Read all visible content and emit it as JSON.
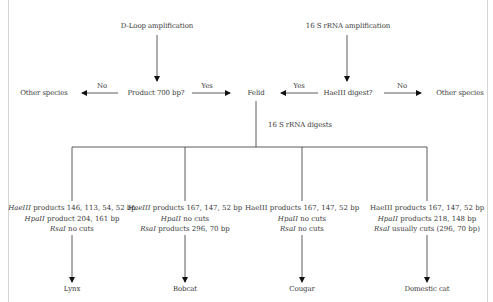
{
  "diagram": {
    "type": "flowchart",
    "start_nodes": {
      "dloop": "D-Loop amplification",
      "rrna": "16 S rRNA amplification"
    },
    "decisions": {
      "product_700": "Product 700 bp?",
      "haeiii_digest": "HaeIII digest?"
    },
    "outcomes": {
      "other_species_left": "Other species",
      "felid": "Felid",
      "other_species_right": "Other species"
    },
    "edge_labels": {
      "no_left": "No",
      "yes_left": "Yes",
      "yes_right": "Yes",
      "no_right": "No",
      "digests": "16 S rRNA digests"
    },
    "branches": [
      {
        "lines": [
          {
            "enzyme": "HaeIII",
            "text": " products 146, 113, 54, 52 bp"
          },
          {
            "enzyme": "HpaII",
            "text": " product 204, 161 bp"
          },
          {
            "enzyme": "RsaI",
            "text": " no cuts"
          }
        ],
        "result": "Lynx"
      },
      {
        "lines": [
          {
            "enzyme": "HaeIII",
            "text": " products 167, 147, 52 bp"
          },
          {
            "enzyme": "HpaII",
            "text": " no cuts"
          },
          {
            "enzyme": "RsaI",
            "text": " products 296, 70 bp"
          }
        ],
        "result": "Bobcat"
      },
      {
        "lines": [
          {
            "enzyme": "HaeIII",
            "text": " products 167, 147, 52 bp"
          },
          {
            "enzyme": "HpaII",
            "text": " no cuts"
          },
          {
            "enzyme": "RsaI",
            "text": " no cuts"
          }
        ],
        "result": "Cougar"
      },
      {
        "lines": [
          {
            "enzyme": "HaeIII",
            "text": " products 167, 147, 52 bp"
          },
          {
            "enzyme": "HpaII",
            "text": " products 218, 148 bp"
          },
          {
            "enzyme": "RsaI",
            "text": " usually cuts (296, 70 bp)"
          }
        ],
        "result": "Domestic cat"
      }
    ]
  }
}
